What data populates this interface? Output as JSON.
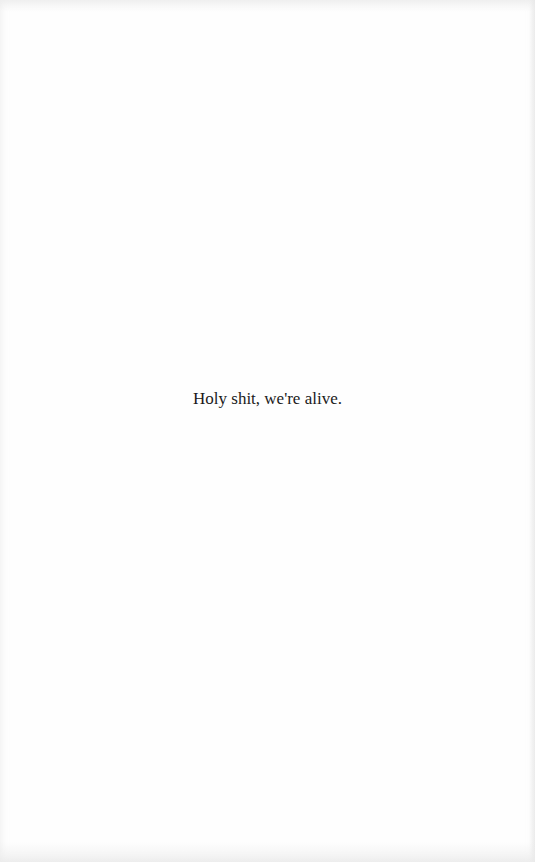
{
  "page": {
    "lines": [
      {
        "text": "Holy shit, we're alive."
      }
    ]
  }
}
